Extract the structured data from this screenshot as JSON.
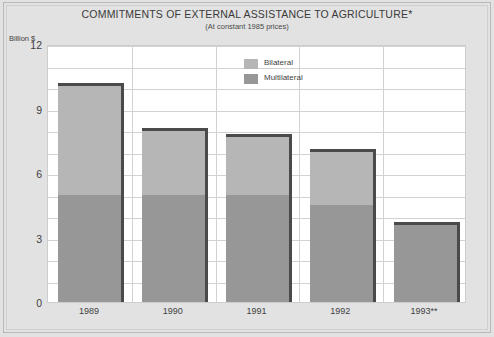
{
  "chart_data": {
    "type": "bar",
    "title": "COMMITMENTS OF EXTERNAL ASSISTANCE TO AGRICULTURE*",
    "subtitle": "(At constant 1985 prices)",
    "stacked": true,
    "grid": true,
    "legend_position": "inside-top-center",
    "xlabel": "",
    "ylabel": "Billion $",
    "ylim": [
      0,
      12
    ],
    "ytick_labels": [
      "0",
      "3",
      "6",
      "9",
      "12"
    ],
    "ytick_values": [
      0,
      3,
      6,
      9,
      12
    ],
    "minor_gridline_step": 1,
    "categories": [
      "1989",
      "1990",
      "1991",
      "1992",
      "1993**"
    ],
    "series": [
      {
        "name": "Multilateral",
        "color": "#979797",
        "values": [
          5.0,
          5.0,
          5.0,
          4.5,
          3.7
        ]
      },
      {
        "name": "Bilateral",
        "color": "#b6b6b6",
        "values": [
          5.2,
          3.1,
          2.8,
          2.6,
          0.0
        ]
      }
    ],
    "totals": [
      10.2,
      8.1,
      7.8,
      7.1,
      3.7
    ],
    "units": "Billion $"
  },
  "legend": {
    "items": [
      {
        "label": "Bilateral",
        "color": "#b6b6b6"
      },
      {
        "label": "Multilateral",
        "color": "#979797"
      }
    ]
  },
  "colors": {
    "background": "#e2e2e2",
    "plot_background": "#ffffff",
    "gridline": "#d2d2d2",
    "bar_edge": "#4a4a4a",
    "bilateral": "#b6b6b6",
    "multilateral": "#979797",
    "text": "#3f3f3f"
  }
}
